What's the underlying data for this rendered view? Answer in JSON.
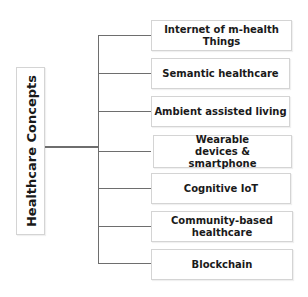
{
  "diagram": {
    "root": {
      "label": "Healthcare Concepts"
    },
    "children": [
      {
        "label": "Internet of m-health Things"
      },
      {
        "label": "Semantic healthcare"
      },
      {
        "label": "Ambient assisted living"
      },
      {
        "label": "Wearable devices & smartphone"
      },
      {
        "label": "Cognitive IoT"
      },
      {
        "label": "Community-based healthcare"
      },
      {
        "label": "Blockchain"
      }
    ],
    "colors": {
      "connector": "#6e6e6e",
      "box_border": "#d4d4d4",
      "text": "#1a1a1a"
    }
  }
}
